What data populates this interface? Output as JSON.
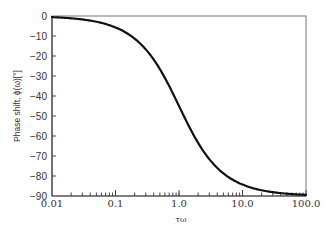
{
  "chart_data": {
    "type": "line",
    "title": "",
    "xlabel": "τω",
    "ylabel": "Phase shift, ϕ(ω)[°]",
    "xscale": "log",
    "xlim": [
      0.01,
      100.0
    ],
    "ylim": [
      -90,
      0
    ],
    "grid": false,
    "legend": null,
    "x_tick_labels": [
      "0.01",
      "0.1",
      "1.0",
      "10.0",
      "100.0"
    ],
    "y_tick_labels": [
      "0",
      "-10",
      "-20",
      "-30",
      "-40",
      "-50",
      "-60",
      "-70",
      "-80",
      "-90"
    ],
    "series": [
      {
        "name": "phase shift",
        "formula": "phi = -arctan(tau*omega)",
        "x": [
          0.01,
          0.02,
          0.05,
          0.1,
          0.2,
          0.5,
          1.0,
          2.0,
          5.0,
          10.0,
          20.0,
          50.0,
          100.0
        ],
        "y": [
          -0.6,
          -1.1,
          -2.9,
          -5.7,
          -11.3,
          -26.6,
          -45.0,
          -63.4,
          -78.7,
          -84.3,
          -87.1,
          -88.9,
          -89.4
        ]
      }
    ],
    "colors": {
      "line": "#111111",
      "axes": "#555555",
      "text": "#333333"
    }
  }
}
